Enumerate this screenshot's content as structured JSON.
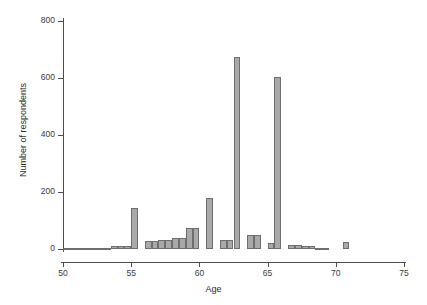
{
  "chart_data": {
    "type": "bar",
    "title": "",
    "subtitle": "",
    "xlabel": "Age",
    "ylabel": "Number of respondents",
    "xlim": [
      50,
      75
    ],
    "ylim": [
      0,
      800
    ],
    "xticks": [
      50,
      55,
      60,
      65,
      70,
      75
    ],
    "yticks": [
      0,
      200,
      400,
      600,
      800
    ],
    "grid": false,
    "legend": null,
    "bin_width": 0.5,
    "bar_color": "#a9a9a9",
    "bar_edge_color": "#6e6e6e",
    "axis_color": "#4d4d4d",
    "background": "#ffffff",
    "categories": [
      "50.0",
      "50.5",
      "51.0",
      "51.5",
      "52.0",
      "52.5",
      "53.0",
      "53.5",
      "54.0",
      "54.5",
      "55.0",
      "55.5",
      "56.0",
      "56.5",
      "57.0",
      "57.5",
      "58.0",
      "58.5",
      "59.0",
      "59.5",
      "60.0",
      "60.5",
      "61.0",
      "61.5",
      "62.0",
      "62.5",
      "63.0",
      "63.5",
      "64.0",
      "64.5",
      "65.0",
      "65.5",
      "66.0",
      "66.5",
      "67.0",
      "67.5",
      "68.0",
      "68.5",
      "69.0",
      "69.5",
      "70.0",
      "70.5",
      "71.0",
      "71.5",
      "72.0",
      "72.5",
      "73.0",
      "73.5",
      "74.0",
      "74.5"
    ],
    "bin_starts": [
      50.0,
      50.5,
      51.0,
      51.5,
      52.0,
      52.5,
      53.0,
      53.5,
      54.0,
      54.5,
      55.0,
      55.5,
      56.0,
      56.5,
      57.0,
      57.5,
      58.0,
      58.5,
      59.0,
      59.5,
      60.0,
      60.5,
      61.0,
      61.5,
      62.0,
      62.5,
      63.0,
      63.5,
      64.0,
      64.5,
      65.0,
      65.5,
      66.0,
      66.5,
      67.0,
      67.5,
      68.0,
      68.5,
      69.0,
      69.5,
      70.0,
      70.5,
      71.0,
      71.5,
      72.0,
      72.5,
      73.0,
      73.5,
      74.0,
      74.5
    ],
    "values": [
      4,
      3,
      2,
      2,
      3,
      4,
      5,
      9,
      11,
      12,
      144,
      0,
      29,
      29,
      33,
      33,
      40,
      40,
      75,
      75,
      0,
      179,
      0,
      30,
      30,
      672,
      0,
      50,
      50,
      0,
      22,
      603,
      0,
      15,
      15,
      10,
      10,
      5,
      5,
      0,
      0,
      25,
      0,
      0,
      0,
      0,
      0,
      0,
      0,
      0
    ],
    "peaks": [
      {
        "bin": "55.0",
        "value": 144
      },
      {
        "bin": "60.5",
        "value": 179
      },
      {
        "bin": "62.5",
        "value": 672
      },
      {
        "bin": "65.5",
        "value": 603
      },
      {
        "bin": "70.5",
        "value": 25
      }
    ]
  }
}
